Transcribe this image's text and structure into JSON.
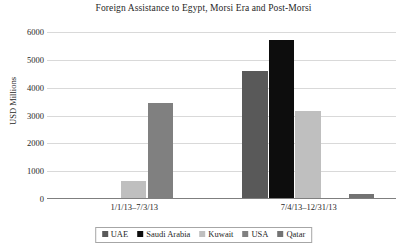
{
  "chart_data": {
    "type": "bar",
    "title": "Foreign Assistance to Egypt, Morsi Era and Post-Morsi",
    "xlabel": "",
    "ylabel": "USD Millions",
    "ylim": [
      0,
      6000
    ],
    "yticks": [
      0,
      1000,
      2000,
      3000,
      4000,
      5000,
      6000
    ],
    "ytick_labels": [
      "0",
      "1000",
      "2000",
      "3000",
      "4000",
      "5000",
      "6000"
    ],
    "grid": true,
    "legend_position": "bottom",
    "categories": [
      "1/1/13–7/3/13",
      "7/4/13–12/31/13"
    ],
    "series": [
      {
        "name": "UAE",
        "color": "#595959",
        "values": [
          50,
          4600
        ]
      },
      {
        "name": "Saudi Arabia",
        "color": "#0d0d0d",
        "values": [
          20,
          5700
        ]
      },
      {
        "name": "Kuwait",
        "color": "#bfbfbf",
        "values": [
          650,
          3150
        ]
      },
      {
        "name": "USA",
        "color": "#808080",
        "values": [
          3450,
          0
        ]
      },
      {
        "name": "Qatar",
        "color": "#737373",
        "values": [
          0,
          180
        ]
      }
    ]
  }
}
